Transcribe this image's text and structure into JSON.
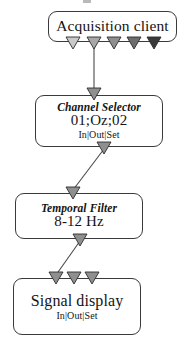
{
  "diagram": {
    "type": "flow-diagram",
    "background_color": "#ffffff",
    "line_color": "#3a3a3a",
    "nodes": [
      {
        "id": "acquisition-client",
        "title": "Acquisition client",
        "title_style": "plain",
        "value": "",
        "ports": "",
        "outputs": 5,
        "output_shades": [
          "#c9c9c9",
          "#a8a8a8",
          "#8f8f8f",
          "#6e6e6e",
          "#3a3a3a"
        ]
      },
      {
        "id": "channel-selector",
        "title": "Channel Selector",
        "title_style": "italic",
        "value": "01;Oz;02",
        "ports": "In|Out|Set",
        "inputs": 1,
        "outputs": 1
      },
      {
        "id": "temporal-filter",
        "title": "Temporal Filter",
        "title_style": "italic",
        "value": "8-12 Hz",
        "ports": "",
        "inputs": 1,
        "outputs": 1
      },
      {
        "id": "signal-display",
        "title": "Signal display",
        "title_style": "plain",
        "value": "",
        "ports": "In|Out|Set",
        "inputs": 3,
        "outputs": 0
      }
    ],
    "connectors": [
      {
        "id": "acquisition-to-channel",
        "from": "acquisition-client",
        "to": "channel-selector",
        "shape": "vertical"
      },
      {
        "id": "channel-to-temporal",
        "from": "channel-selector",
        "to": "temporal-filter",
        "shape": "diagonal"
      },
      {
        "id": "temporal-to-signal",
        "from": "temporal-filter",
        "to": "signal-display",
        "shape": "diagonal"
      }
    ],
    "marker": {
      "shape": "down-triangle",
      "fill": "#8f8f8f",
      "stroke": "#2c2c2c"
    }
  }
}
